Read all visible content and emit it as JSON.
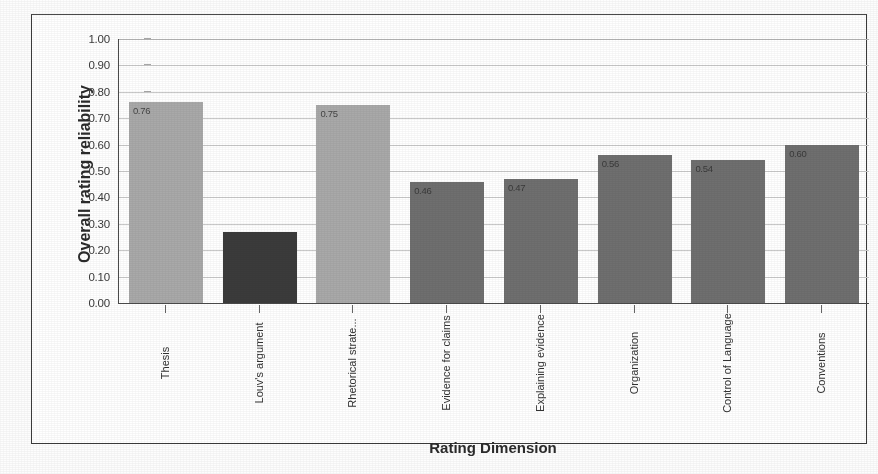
{
  "chart_data": {
    "type": "bar",
    "title": "",
    "xlabel": "Rating Dimension",
    "ylabel": "Overall rating reliability",
    "categories": [
      "Thesis",
      "Louv's argument",
      "Rhetorical strate...",
      "Evidence for claims",
      "Explaining evidence",
      "Organization",
      "Control of Language",
      "Conventions"
    ],
    "values": [
      0.76,
      0.27,
      0.75,
      0.46,
      0.47,
      0.56,
      0.54,
      0.6
    ],
    "value_labels": [
      "0.76",
      "",
      "0.75",
      "0.46",
      "0.47",
      "0.56",
      "0.54",
      "0.60"
    ],
    "bar_colors": [
      "#a9a9a9",
      "#3b3b3b",
      "#a9a9a9",
      "#6f6f6f",
      "#6f6f6f",
      "#6f6f6f",
      "#6f6f6f",
      "#6f6f6f"
    ],
    "ylim": [
      0.0,
      1.0
    ],
    "ytick_step": 0.1,
    "ytick_labels": [
      "1.00",
      "0.90",
      "0.80",
      "0.70",
      "0.60",
      "0.50",
      "0.40",
      "0.30",
      "0.20",
      "0.10",
      "0.00"
    ],
    "grid": true,
    "grid_axis": "y",
    "legend": "none",
    "legend_position": "none",
    "xtick_rotation": -90
  },
  "axes": {
    "y_title": "Overall rating reliability",
    "x_title": "Rating Dimension"
  },
  "colors": {
    "light_bar": "#a9a9a9",
    "mid_bar": "#6f6f6f",
    "dark_bar": "#3b3b3b",
    "gridline": "#c9c9c9",
    "axis": "#4a4a4a",
    "frame": "#3a3a3a",
    "text": "#2b2b2b",
    "background": "#ffffff"
  }
}
